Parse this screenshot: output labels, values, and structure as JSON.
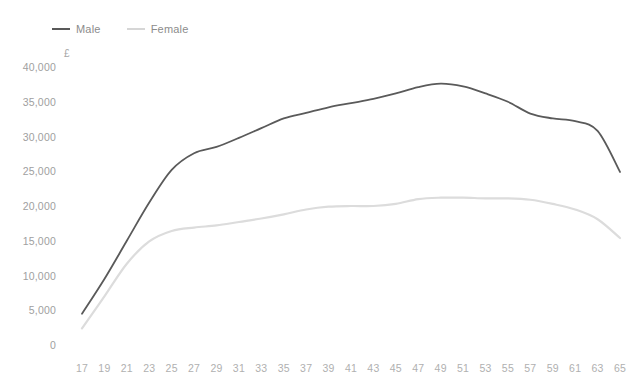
{
  "chart_data": {
    "type": "line",
    "title": "",
    "subtitle": "",
    "xlabel": "",
    "ylabel": "£",
    "unit_symbol": "£",
    "grid": false,
    "legend_position": "top-left",
    "xlim": [
      17,
      65
    ],
    "ylim": [
      0,
      40000
    ],
    "ytick_labels": [
      "40,000",
      "35,000",
      "30,000",
      "25,000",
      "20,000",
      "15,000",
      "10,000",
      "5,000",
      "0"
    ],
    "ytick_values": [
      40000,
      35000,
      30000,
      25000,
      20000,
      15000,
      10000,
      5000,
      0
    ],
    "xtick_labels": [
      "17",
      "19",
      "21",
      "23",
      "25",
      "27",
      "29",
      "31",
      "33",
      "35",
      "37",
      "39",
      "41",
      "43",
      "45",
      "47",
      "49",
      "51",
      "53",
      "55",
      "57",
      "59",
      "61",
      "63",
      "65"
    ],
    "x": [
      17,
      19,
      21,
      23,
      25,
      27,
      29,
      31,
      33,
      35,
      37,
      39,
      41,
      43,
      45,
      47,
      49,
      51,
      53,
      55,
      57,
      59,
      61,
      63,
      65
    ],
    "series": [
      {
        "name": "Male",
        "color": "#5a5a5a",
        "values": [
          4500,
          9500,
          15000,
          20500,
          25200,
          27600,
          28500,
          29800,
          31200,
          32600,
          33400,
          34200,
          34800,
          35400,
          36200,
          37100,
          37600,
          37200,
          36200,
          35000,
          33300,
          32600,
          32200,
          30800,
          24900
        ]
      },
      {
        "name": "Female",
        "color": "#dcdcdc",
        "values": [
          2400,
          7000,
          11700,
          14900,
          16400,
          16900,
          17200,
          17700,
          18200,
          18800,
          19500,
          19900,
          20000,
          20000,
          20300,
          21000,
          21200,
          21200,
          21100,
          21100,
          20900,
          20300,
          19500,
          18100,
          15400
        ]
      }
    ]
  },
  "legend": {
    "items": [
      {
        "label": "Male",
        "color": "#5a5a5a"
      },
      {
        "label": "Female",
        "color": "#dcdcdc"
      }
    ]
  },
  "colors": {
    "male": "#5a5a5a",
    "female": "#dcdcdc",
    "axis_text": "#a6a6a6",
    "background": "#ffffff"
  }
}
